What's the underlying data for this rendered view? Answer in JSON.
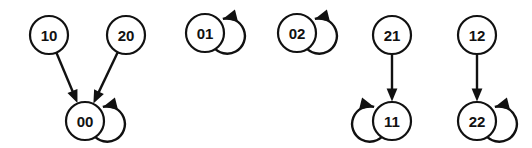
{
  "diagram": {
    "background_color": "#ffffff",
    "stroke_color": "#111111",
    "label_color": "#111111",
    "node_fill": "#ffffff",
    "node_radius": 19,
    "node_stroke_width": 2.2,
    "edge_stroke_width": 2.4,
    "label_font_size": 15,
    "width": 532,
    "height": 148,
    "nodes": [
      {
        "id": "n10",
        "label": "10",
        "cx": 49,
        "cy": 35,
        "self_loop": false,
        "loop_side": null
      },
      {
        "id": "n20",
        "label": "20",
        "cx": 126,
        "cy": 35,
        "self_loop": false,
        "loop_side": null
      },
      {
        "id": "n00",
        "label": "00",
        "cx": 85,
        "cy": 121,
        "self_loop": true,
        "loop_side": "right"
      },
      {
        "id": "n01",
        "label": "01",
        "cx": 205,
        "cy": 33,
        "self_loop": true,
        "loop_side": "right"
      },
      {
        "id": "n02",
        "label": "02",
        "cx": 297,
        "cy": 33,
        "self_loop": true,
        "loop_side": "right"
      },
      {
        "id": "n21",
        "label": "21",
        "cx": 392,
        "cy": 35,
        "self_loop": false,
        "loop_side": null
      },
      {
        "id": "n11",
        "label": "11",
        "cx": 392,
        "cy": 121,
        "self_loop": true,
        "loop_side": "left"
      },
      {
        "id": "n12",
        "label": "12",
        "cx": 477,
        "cy": 35,
        "self_loop": false,
        "loop_side": null
      },
      {
        "id": "n22",
        "label": "22",
        "cx": 477,
        "cy": 121,
        "self_loop": true,
        "loop_side": "right"
      }
    ],
    "edges": [
      {
        "id": "e10-00",
        "from": "n10",
        "to": "n00",
        "from_label": "10",
        "to_label": "00"
      },
      {
        "id": "e20-00",
        "from": "n20",
        "to": "n00",
        "from_label": "20",
        "to_label": "00"
      },
      {
        "id": "e21-11",
        "from": "n21",
        "to": "n11",
        "from_label": "21",
        "to_label": "11"
      },
      {
        "id": "e12-22",
        "from": "n12",
        "to": "n22",
        "from_label": "12",
        "to_label": "22"
      }
    ],
    "self_loops": [
      {
        "id": "l00",
        "node": "n00",
        "node_label": "00",
        "side": "right"
      },
      {
        "id": "l01",
        "node": "n01",
        "node_label": "01",
        "side": "right"
      },
      {
        "id": "l02",
        "node": "n02",
        "node_label": "02",
        "side": "right"
      },
      {
        "id": "l11",
        "node": "n11",
        "node_label": "11",
        "side": "left"
      },
      {
        "id": "l22",
        "node": "n22",
        "node_label": "22",
        "side": "right"
      }
    ]
  }
}
